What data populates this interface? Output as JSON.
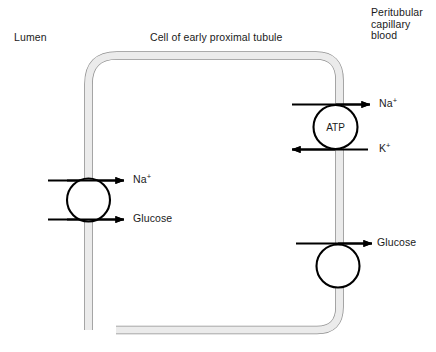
{
  "figure": {
    "title_labels": {
      "lumen": "Lumen",
      "cell": "Cell of early proximal tubule",
      "blood_line1": "Peritubular",
      "blood_line2": "capillary",
      "blood_line3": "blood"
    },
    "colors": {
      "membrane_fill": "#e9e9e9",
      "membrane_stroke": "#8f8f8f",
      "arrow": "#000000",
      "text": "#1a1a1a",
      "background": "#ffffff",
      "transporter_fill": "#ffffff",
      "transporter_stroke": "#000000"
    },
    "transporters": [
      {
        "id": "apical-sglt",
        "inner_label": "",
        "membrane": "apical",
        "arrows": [
          {
            "species": "Na",
            "charge": "+",
            "label": "Na",
            "superscript": "+",
            "direction": "right"
          },
          {
            "species": "Glucose",
            "charge": "",
            "label": "Glucose",
            "superscript": "",
            "direction": "right"
          }
        ]
      },
      {
        "id": "basolateral-na-k-atpase",
        "inner_label": "ATP",
        "membrane": "basolateral",
        "arrows": [
          {
            "species": "Na",
            "charge": "+",
            "label": "Na",
            "superscript": "+",
            "direction": "right"
          },
          {
            "species": "K",
            "charge": "+",
            "label": "K",
            "superscript": "+",
            "direction": "left"
          }
        ]
      },
      {
        "id": "basolateral-glut",
        "inner_label": "",
        "membrane": "basolateral",
        "arrows": [
          {
            "species": "Glucose",
            "charge": "",
            "label": "Glucose",
            "superscript": "",
            "direction": "right"
          }
        ]
      }
    ]
  }
}
